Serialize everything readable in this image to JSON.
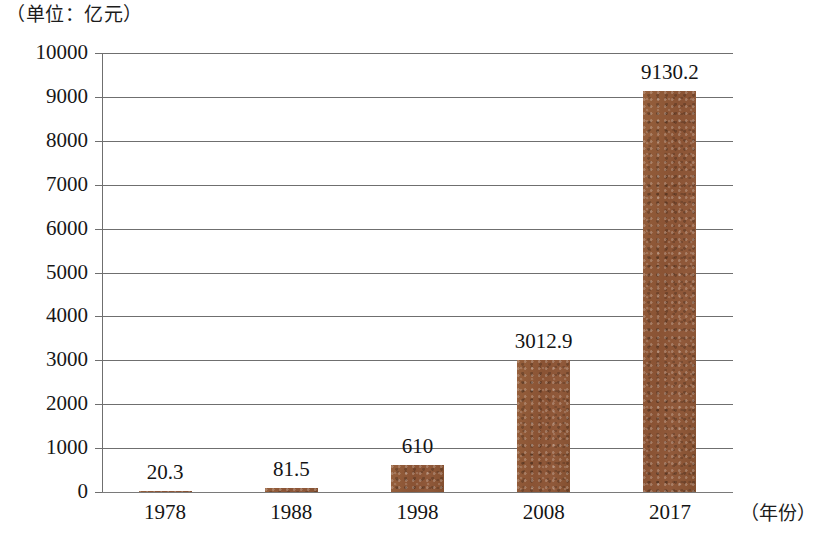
{
  "chart_data": {
    "type": "bar",
    "title": "",
    "unit_caption": "（单位：亿元）",
    "xlabel": "（年份）",
    "ylabel": "",
    "categories": [
      "1978",
      "1988",
      "1998",
      "2008",
      "2017"
    ],
    "values": [
      20.3,
      81.5,
      610,
      3012.9,
      9130.2
    ],
    "value_labels": [
      "20.3",
      "81.5",
      "610",
      "3012.9",
      "9130.2"
    ],
    "ylim": [
      0,
      10000
    ],
    "ytick_step": 1000,
    "ytick_labels": [
      "10000",
      "9000",
      "8000",
      "7000",
      "6000",
      "5000",
      "4000",
      "3000",
      "2000",
      "1000",
      "0"
    ],
    "grid": true,
    "legend": "none",
    "bar_color": "#8c5636",
    "axis_color": "#6f6f6f"
  }
}
